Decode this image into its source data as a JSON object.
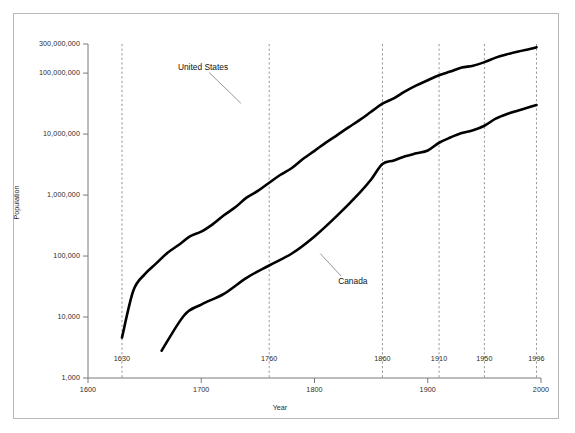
{
  "chart_data": {
    "type": "line",
    "title": "",
    "xlabel": "Year",
    "ylabel": "Population",
    "xlim": [
      1600,
      2000
    ],
    "ylim": [
      1000,
      400000000
    ],
    "yscale": "log",
    "grid": false,
    "legend_position": "inline-annotation",
    "x_ticks": [
      "1600",
      "1700",
      "1800",
      "1900",
      "2000"
    ],
    "x_tick_values": [
      1600,
      1700,
      1800,
      1900,
      2000
    ],
    "y_ticks": [
      "300,000,000",
      "100,000,000",
      "10,000,000",
      "1,000,000",
      "100,000",
      "10,000",
      "1,000"
    ],
    "y_tick_values": [
      300000000,
      100000000,
      10000000,
      1000000,
      100000,
      10000,
      1000
    ],
    "reference_lines": [
      {
        "label": "1630",
        "value": 1630
      },
      {
        "label": "1760",
        "value": 1760
      },
      {
        "label": "1860",
        "value": 1860
      },
      {
        "label": "1910",
        "value": 1910
      },
      {
        "label": "1950",
        "value": 1950
      },
      {
        "label": "1996",
        "value": 1996
      }
    ],
    "series": [
      {
        "name": "United States",
        "label": "United States",
        "color": "#000000",
        "x": [
          1630,
          1640,
          1650,
          1660,
          1670,
          1680,
          1690,
          1700,
          1710,
          1720,
          1730,
          1740,
          1750,
          1760,
          1770,
          1780,
          1790,
          1800,
          1810,
          1820,
          1830,
          1840,
          1850,
          1860,
          1870,
          1880,
          1890,
          1900,
          1910,
          1920,
          1930,
          1940,
          1950,
          1960,
          1970,
          1980,
          1990,
          1996
        ],
        "y": [
          4600,
          27000,
          50000,
          75000,
          112000,
          152000,
          210000,
          251000,
          331000,
          466000,
          629000,
          906000,
          1170000,
          1590000,
          2150000,
          2780000,
          3929000,
          5308000,
          7240000,
          9638000,
          12866000,
          17069000,
          23192000,
          31443000,
          38558000,
          50189000,
          62980000,
          76212000,
          92228000,
          106021000,
          123202000,
          132165000,
          151325000,
          179323000,
          203211000,
          226545000,
          248709000,
          265000000
        ]
      },
      {
        "name": "Canada",
        "label": "Canada",
        "color": "#000000",
        "x": [
          1665,
          1685,
          1700,
          1720,
          1740,
          1760,
          1780,
          1800,
          1820,
          1840,
          1850,
          1860,
          1870,
          1880,
          1890,
          1900,
          1910,
          1920,
          1930,
          1940,
          1950,
          1960,
          1970,
          1980,
          1990,
          1996
        ],
        "y": [
          2800,
          10700,
          16000,
          24000,
          44000,
          70000,
          110000,
          210000,
          460000,
          1100000,
          1800000,
          3230000,
          3689000,
          4325000,
          4833000,
          5371000,
          7207000,
          8788000,
          10377000,
          11507000,
          13712000,
          17870000,
          21297000,
          24343000,
          27700000,
          29960000
        ]
      }
    ],
    "annotations": [
      {
        "name": "United States",
        "text": "United States",
        "anchor_x": 1735,
        "anchor_y": 32000000
      },
      {
        "name": "Canada",
        "text": "Canada",
        "anchor_x": 1805,
        "anchor_y": 110000
      }
    ]
  },
  "labels": {
    "y_axis_title": "Population",
    "x_axis_title": "Year",
    "us_label": "United States",
    "canada_label": "Canada"
  },
  "colors": {
    "line": "#000000",
    "axis": "#7a7a7a",
    "reference_line": "#8a8a8a",
    "frame": "#b9b9b9",
    "text": "#2b2b2b",
    "background": "#ffffff"
  }
}
